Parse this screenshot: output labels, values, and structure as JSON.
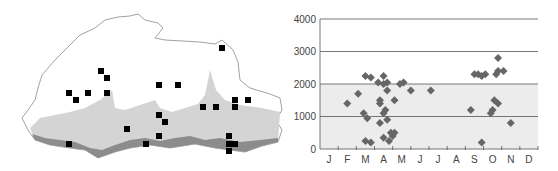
{
  "map": {
    "description": "Map with elevation shading and collection-site markers",
    "colors": {
      "outline": "#888888",
      "lowland": "#8c8c8c",
      "midland": "#d2d2d2",
      "highland": "#ffffff",
      "marker": "#000000"
    },
    "markers": [
      [
        222,
        48
      ],
      [
        101,
        71
      ],
      [
        107,
        78
      ],
      [
        69,
        93
      ],
      [
        88,
        93
      ],
      [
        107,
        93
      ],
      [
        76,
        100
      ],
      [
        159,
        85
      ],
      [
        178,
        85
      ],
      [
        216,
        107
      ],
      [
        235,
        100
      ],
      [
        248,
        100
      ],
      [
        203,
        107
      ],
      [
        235,
        107
      ],
      [
        159,
        115
      ],
      [
        165,
        122
      ],
      [
        127,
        129
      ],
      [
        159,
        136
      ],
      [
        146,
        144
      ],
      [
        69,
        144
      ],
      [
        229,
        136
      ],
      [
        229,
        144
      ],
      [
        235,
        144
      ],
      [
        229,
        151
      ]
    ]
  },
  "chart_data": {
    "type": "scatter",
    "title": "",
    "xlabel": "",
    "ylabel": "",
    "categories": [
      "J",
      "F",
      "M",
      "A",
      "M",
      "J",
      "J",
      "A",
      "S",
      "O",
      "N",
      "D"
    ],
    "yticks": [
      0,
      1000,
      2000,
      3000,
      4000
    ],
    "ylim": [
      0,
      4000
    ],
    "grid": "horizontal",
    "shading": {
      "from": 0,
      "to": 2000,
      "color": "#ececec"
    },
    "marker_color": "#666666",
    "points": [
      {
        "month": 2.0,
        "value": 1400
      },
      {
        "month": 2.6,
        "value": 1700
      },
      {
        "month": 3.0,
        "value": 2250
      },
      {
        "month": 3.3,
        "value": 2200
      },
      {
        "month": 2.9,
        "value": 1100
      },
      {
        "month": 3.1,
        "value": 950
      },
      {
        "month": 3.0,
        "value": 250
      },
      {
        "month": 3.3,
        "value": 200
      },
      {
        "month": 3.7,
        "value": 2050
      },
      {
        "month": 4.0,
        "value": 2250
      },
      {
        "month": 4.0,
        "value": 2000
      },
      {
        "month": 4.2,
        "value": 2050
      },
      {
        "month": 4.2,
        "value": 1800
      },
      {
        "month": 3.8,
        "value": 1500
      },
      {
        "month": 3.8,
        "value": 1400
      },
      {
        "month": 4.1,
        "value": 1200
      },
      {
        "month": 4.0,
        "value": 1100
      },
      {
        "month": 3.8,
        "value": 800
      },
      {
        "month": 4.2,
        "value": 900
      },
      {
        "month": 4.0,
        "value": 350
      },
      {
        "month": 4.3,
        "value": 250
      },
      {
        "month": 4.4,
        "value": 500
      },
      {
        "month": 4.6,
        "value": 500
      },
      {
        "month": 4.5,
        "value": 400
      },
      {
        "month": 4.6,
        "value": 1500
      },
      {
        "month": 4.9,
        "value": 2000
      },
      {
        "month": 5.1,
        "value": 2050
      },
      {
        "month": 5.5,
        "value": 1800
      },
      {
        "month": 6.6,
        "value": 1800
      },
      {
        "month": 8.8,
        "value": 1200
      },
      {
        "month": 9.0,
        "value": 2300
      },
      {
        "month": 9.2,
        "value": 2300
      },
      {
        "month": 9.4,
        "value": 2250
      },
      {
        "month": 9.6,
        "value": 2300
      },
      {
        "month": 9.4,
        "value": 200
      },
      {
        "month": 9.9,
        "value": 1100
      },
      {
        "month": 10.0,
        "value": 1200
      },
      {
        "month": 10.1,
        "value": 1500
      },
      {
        "month": 10.3,
        "value": 1400
      },
      {
        "month": 10.2,
        "value": 2300
      },
      {
        "month": 10.3,
        "value": 2400
      },
      {
        "month": 10.3,
        "value": 2800
      },
      {
        "month": 10.6,
        "value": 2400
      },
      {
        "month": 11.0,
        "value": 800
      }
    ]
  }
}
